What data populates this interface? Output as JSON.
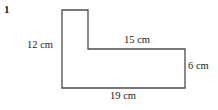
{
  "figure": {
    "number": "1",
    "type": "l-shaped-polygon",
    "stroke_color": "#4d4d4d",
    "fill_color": "#ffffff",
    "background_color": "#ffffff",
    "stroke_width": 1.3
  },
  "labels": {
    "left": {
      "value": "12",
      "unit": "cm",
      "full": "12 cm"
    },
    "top": {
      "value": "15",
      "unit": "cm",
      "full": "15 cm"
    },
    "right": {
      "value": "6",
      "unit": "cm",
      "full": "6 cm"
    },
    "bottom": {
      "value": "19",
      "unit": "cm",
      "full": "19 cm"
    }
  },
  "geometry": {
    "points": "62,10 88,10 88,49 185,49 185,88 62,88",
    "vertices": [
      {
        "name": "top-left",
        "x": 62,
        "y": 10
      },
      {
        "name": "top-right-of-stem",
        "x": 88,
        "y": 10
      },
      {
        "name": "inner-corner",
        "x": 88,
        "y": 49
      },
      {
        "name": "upper-right",
        "x": 185,
        "y": 49
      },
      {
        "name": "bottom-right",
        "x": 185,
        "y": 88
      },
      {
        "name": "bottom-left",
        "x": 62,
        "y": 88
      }
    ]
  }
}
